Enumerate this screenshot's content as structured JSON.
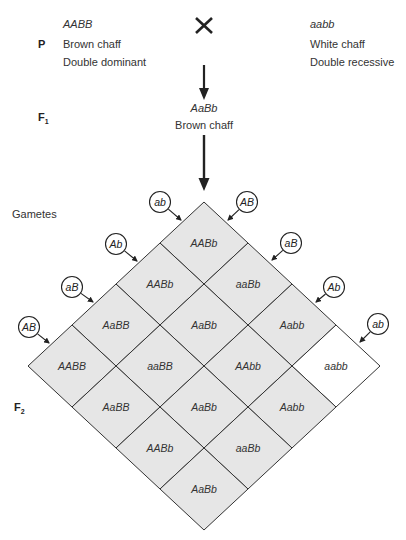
{
  "parents": {
    "generation_label": "P",
    "cross_symbol": "×",
    "left": {
      "genotype": "AABB",
      "phenotype": "Brown chaff",
      "description": "Double dominant"
    },
    "right": {
      "genotype": "aabb",
      "phenotype": "White chaff",
      "description": "Double recessive"
    }
  },
  "f1": {
    "generation_label": "F",
    "generation_sub": "1",
    "genotype": "AaBb",
    "phenotype": "Brown chaff"
  },
  "gametes_label": "Gametes",
  "f2": {
    "generation_label": "F",
    "generation_sub": "2"
  },
  "gametes": {
    "left_edge": [
      "ab",
      "Ab",
      "aB",
      "AB"
    ],
    "right_edge": [
      "AB",
      "aB",
      "Ab",
      "ab"
    ]
  },
  "grid": [
    {
      "row": 0,
      "col": 0,
      "genotype": "AABb",
      "shaded": true
    },
    {
      "row": 1,
      "col": 0,
      "genotype": "AABb",
      "shaded": true
    },
    {
      "row": 0,
      "col": 1,
      "genotype": "aaBb",
      "shaded": true
    },
    {
      "row": 2,
      "col": 0,
      "genotype": "AaBB",
      "shaded": true
    },
    {
      "row": 1,
      "col": 1,
      "genotype": "AaBb",
      "shaded": true
    },
    {
      "row": 0,
      "col": 2,
      "genotype": "Aabb",
      "shaded": true
    },
    {
      "row": 3,
      "col": 0,
      "genotype": "AABB",
      "shaded": true
    },
    {
      "row": 2,
      "col": 1,
      "genotype": "aaBB",
      "shaded": true
    },
    {
      "row": 1,
      "col": 2,
      "genotype": "AAbb",
      "shaded": true
    },
    {
      "row": 0,
      "col": 3,
      "genotype": "aabb",
      "shaded": false
    },
    {
      "row": 3,
      "col": 1,
      "genotype": "AaBB",
      "shaded": true
    },
    {
      "row": 2,
      "col": 2,
      "genotype": "AaBb",
      "shaded": true
    },
    {
      "row": 1,
      "col": 3,
      "genotype": "Aabb",
      "shaded": true
    },
    {
      "row": 3,
      "col": 2,
      "genotype": "AABb",
      "shaded": true
    },
    {
      "row": 2,
      "col": 3,
      "genotype": "aaBb",
      "shaded": true
    },
    {
      "row": 3,
      "col": 3,
      "genotype": "AaBb",
      "shaded": true
    }
  ],
  "colors": {
    "shaded_cell": "#e6e6e6",
    "unshaded_cell": "#ffffff",
    "line": "#333333"
  }
}
